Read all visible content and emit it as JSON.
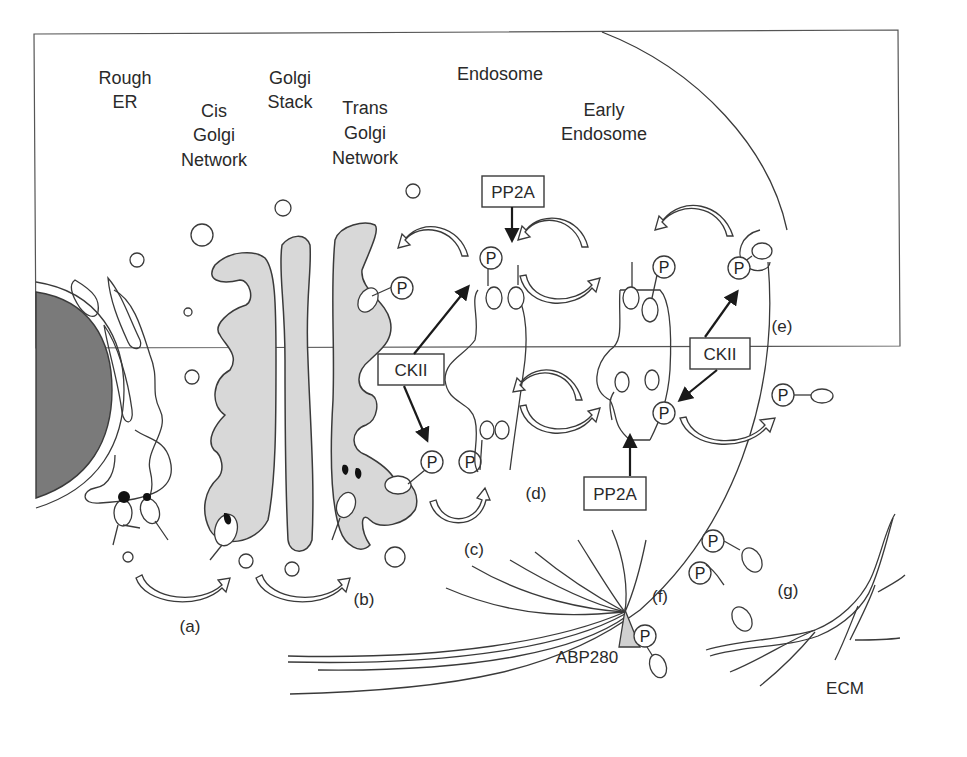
{
  "diagram": {
    "type": "cell-biology-schematic",
    "colors": {
      "background": "#ffffff",
      "line": "#3a3a3a",
      "golgi_fill": "#d8d8d8",
      "nucleus_fill": "#7a7a7a"
    },
    "compartment_labels": {
      "rough_er": [
        "Rough",
        "ER"
      ],
      "cis_golgi": [
        "Cis",
        "Golgi",
        "Network"
      ],
      "golgi_stack": [
        "Golgi",
        "Stack"
      ],
      "trans_golgi": [
        "Trans",
        "Golgi",
        "Network"
      ],
      "endosome": "Endosome",
      "early_endosome": [
        "Early",
        "Endosome"
      ],
      "ecm": "ECM",
      "abp280": "ABP280"
    },
    "enzyme_boxes": {
      "ckii_left": "CKII",
      "ckii_right": "CKII",
      "pp2a_top": "PP2A",
      "pp2a_bottom": "PP2A"
    },
    "phospho_marker": "P",
    "step_labels": {
      "a": "(a)",
      "b": "(b)",
      "c": "(c)",
      "d": "(d)",
      "e": "(e)",
      "f": "(f)",
      "g": "(g)"
    }
  }
}
